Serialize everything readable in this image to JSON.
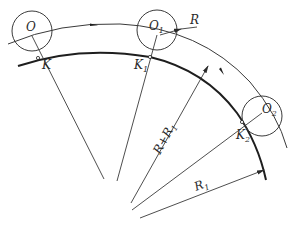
{
  "diagram": {
    "colors": {
      "line": "#3a3a3a",
      "thick_line": "#1e1e1e",
      "background": "#ffffff"
    },
    "labels": {
      "O": "O",
      "O1_main": "O",
      "O1_sub": "1",
      "O2_main": "O",
      "O2_sub": "2",
      "K": "K",
      "K1_main": "K",
      "K1_sub": "1",
      "K2_main": "K",
      "K2_sub": "2",
      "R": "R",
      "R_plus_R1": "R+R",
      "R_plus_R1_sub": "1",
      "R1_main": "R",
      "R1_sub": "1"
    },
    "elements": {
      "roller_circles": [
        "O",
        "O1",
        "O2"
      ],
      "contact_points": [
        "K",
        "K1",
        "K2"
      ],
      "curves": [
        "pitch-curve (thin, radius R+R1)",
        "cam-profile (thick, radius R1)"
      ],
      "dimensions": [
        "R",
        "R+R1",
        "R1"
      ]
    }
  }
}
